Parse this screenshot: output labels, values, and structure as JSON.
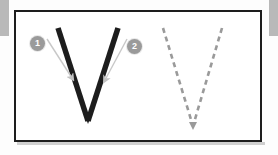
{
  "worksheet": {
    "letter": "V",
    "title": "Letter V stroke order practice",
    "frame_border_color": "#1d1d1d",
    "page_background_color": "#b9b9b9",
    "card_background_color": "#ffffff"
  },
  "model_letter": {
    "label": "V",
    "stroke_color": "#1d1d1d",
    "strokes": [
      {
        "number": "1",
        "from": [
          58,
          28
        ],
        "to": [
          88,
          121
        ],
        "direction": "down-right"
      },
      {
        "number": "2",
        "from": [
          118,
          28
        ],
        "to": [
          88,
          121
        ],
        "direction": "down-left"
      }
    ]
  },
  "stroke_badges": [
    {
      "number": "1",
      "name": "stroke-badge-1",
      "color": "#9a9a9a",
      "text_color": "#ffffff"
    },
    {
      "number": "2",
      "name": "stroke-badge-2",
      "color": "#9a9a9a",
      "text_color": "#ffffff"
    }
  ],
  "direction_arrows": [
    {
      "for_stroke": "1",
      "color": "#c2c2c2",
      "from": [
        47,
        39
      ],
      "to": [
        72,
        78
      ],
      "head": "down-right"
    },
    {
      "for_stroke": "2",
      "color": "#c2c2c2",
      "from": [
        127,
        39
      ],
      "to": [
        105,
        80
      ],
      "head": "down-left"
    }
  ],
  "trace_letter": {
    "label": "V",
    "style": "dashed",
    "stroke_color": "#9a9a9a",
    "dash_pattern": "5 4",
    "strokes": [
      {
        "from": [
          163,
          28
        ],
        "to": [
          193,
          126
        ]
      },
      {
        "from": [
          222,
          28
        ],
        "to": [
          193,
          126
        ]
      }
    ]
  }
}
